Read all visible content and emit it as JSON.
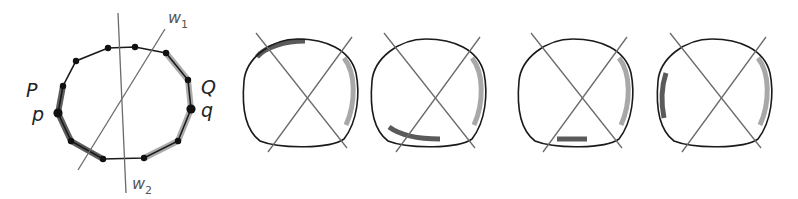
{
  "colors": {
    "outline": "#1a1a1a",
    "line": "#6b6b6b",
    "arc_dark": "#5a5a5a",
    "arc_light": "#a8a8a8",
    "vertex": "#111111"
  },
  "panel0": {
    "labels": {
      "P": "P",
      "p": "p",
      "Q": "Q",
      "q": "q",
      "w1": "w",
      "w1_sub": "1",
      "w2": "w",
      "w2_sub": "2"
    },
    "vertices": [
      [
        108,
        48
      ],
      [
        135,
        47
      ],
      [
        166,
        53
      ],
      [
        188,
        80
      ],
      [
        191,
        109
      ],
      [
        178,
        141
      ],
      [
        144,
        158
      ],
      [
        103,
        159
      ],
      [
        71,
        141
      ],
      [
        58,
        113
      ],
      [
        63,
        86
      ],
      [
        76,
        61
      ]
    ]
  },
  "panels": [
    {
      "id": 1,
      "dark_arc": "top-left",
      "light_arc": "right"
    },
    {
      "id": 2,
      "dark_arc": "bottom-left",
      "light_arc": "right"
    },
    {
      "id": 3,
      "dark_arc": "bottom",
      "light_arc": "right"
    },
    {
      "id": 4,
      "dark_arc": "left",
      "light_arc": "right"
    }
  ]
}
